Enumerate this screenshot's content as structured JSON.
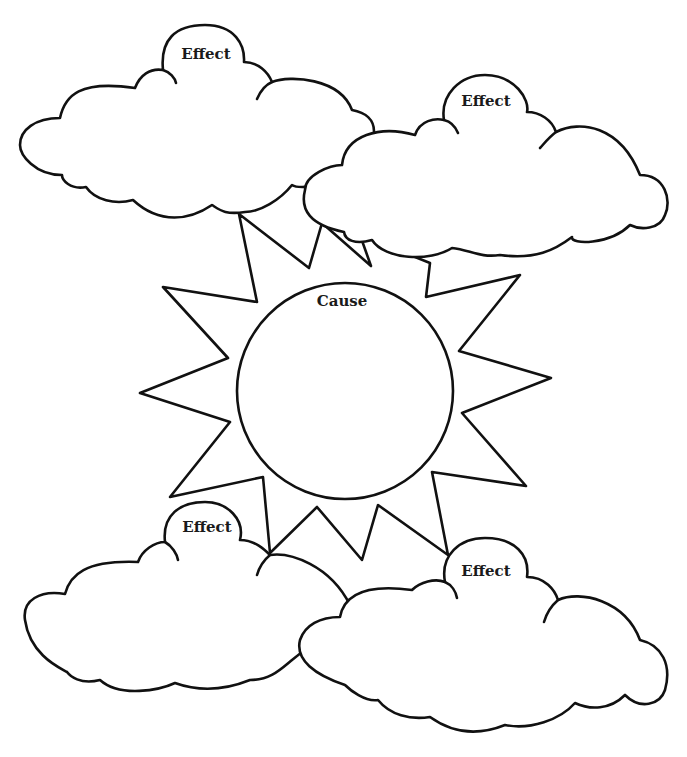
{
  "diagram": {
    "type": "cause-and-effect graphic organizer",
    "center": {
      "shape": "sun",
      "label": "Cause"
    },
    "effects": [
      {
        "position": "top-left",
        "shape": "cloud",
        "label": "Effect"
      },
      {
        "position": "top-right",
        "shape": "cloud",
        "label": "Effect"
      },
      {
        "position": "bottom-left",
        "shape": "cloud",
        "label": "Effect"
      },
      {
        "position": "bottom-right",
        "shape": "cloud",
        "label": "Effect"
      }
    ],
    "colors": {
      "stroke": "#111111",
      "fill": "#ffffff",
      "background": "#ffffff"
    }
  }
}
